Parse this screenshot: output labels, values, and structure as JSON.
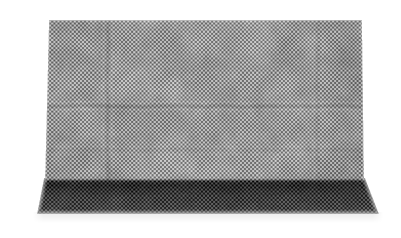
{
  "image": {
    "kind": "natural-image",
    "subject": "mesh-fabric-sheet",
    "caption": "Rectangular sheet of fine dark gray woven mesh fabric photographed flat on a plain white background, with a darker folded hem band across the bottom edge.",
    "background_color": "#ffffff",
    "width": 401,
    "height": 238
  },
  "palette": {
    "background": "#ffffff",
    "mesh_light": "#b4b4b4",
    "mesh_mid": "#808080",
    "mesh_dark": "#4a4a4a",
    "hem_light": "#5a5a5a",
    "hem_mid": "#3a3a3a",
    "hem_dark": "#1c1c1c",
    "selvedge": "#d2d2d2",
    "shadow": "#e6e6e6"
  },
  "geometry": {
    "main_panel": {
      "top": 20,
      "bottom": 181,
      "left_top": 49,
      "left_bottom": 45,
      "right_top": 362,
      "right_bottom": 364
    },
    "hem_band": {
      "top": 178,
      "bottom": 214,
      "left_top": 44,
      "left_bottom": 37,
      "right_top": 365,
      "right_bottom": 379
    },
    "weave_cell_px": 2.05,
    "creases": [
      {
        "orientation": "vertical",
        "x": 108,
        "from_y": 20,
        "to_y": 181,
        "strength": 0.16
      },
      {
        "orientation": "vertical",
        "x": 318,
        "from_y": 20,
        "to_y": 181,
        "strength": 0.09
      },
      {
        "orientation": "horizontal",
        "y": 106,
        "from_x": 49,
        "to_x": 363,
        "strength": 0.2
      },
      {
        "orientation": "horizontal",
        "y": 150,
        "from_x": 49,
        "to_x": 363,
        "strength": 0.07
      }
    ]
  },
  "regions": [
    {
      "name": "main-mesh-panel",
      "label": "Main woven mesh panel"
    },
    {
      "name": "bottom-hem-band",
      "label": "Darker folded hem band along bottom"
    },
    {
      "name": "left-selvedge-edge",
      "label": "Light selvedge along left edge of hem"
    },
    {
      "name": "right-selvedge-edge",
      "label": "Light selvedge flare at right edge of hem"
    },
    {
      "name": "backdrop",
      "label": "White studio backdrop"
    }
  ]
}
